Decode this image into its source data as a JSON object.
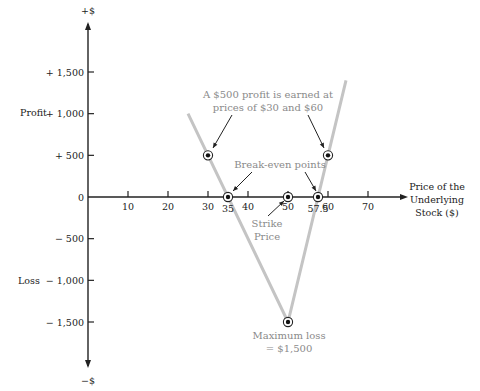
{
  "chart_data": {
    "type": "line",
    "title": "",
    "xlabel": "Price of the Underlying Stock ($)",
    "xlabel_lines": [
      "Price of the",
      "Underlying",
      "Stock ($)"
    ],
    "ylabel_top": "+$",
    "ylabel_bottom": "−$",
    "y_side_labels": {
      "profit": "Profit",
      "loss": "Loss"
    },
    "xlim": [
      0,
      72
    ],
    "ylim": [
      -2000,
      2000
    ],
    "x_ticks": [
      {
        "value": 10,
        "label": "10"
      },
      {
        "value": 20,
        "label": "20"
      },
      {
        "value": 30,
        "label": "30"
      },
      {
        "value": 40,
        "label": "40"
      },
      {
        "value": 50,
        "label": "50"
      },
      {
        "value": 60,
        "label": "60"
      },
      {
        "value": 70,
        "label": "70"
      }
    ],
    "x_extra_labels": [
      {
        "value": 35,
        "label": "35"
      },
      {
        "value": 57.5,
        "label": "57.5"
      }
    ],
    "y_ticks": [
      {
        "value": 1500,
        "label": "+ 1,500"
      },
      {
        "value": 1000,
        "label": "+ 1,000"
      },
      {
        "value": 500,
        "label": "+ 500"
      },
      {
        "value": 0,
        "label": "0"
      },
      {
        "value": -500,
        "label": "− 500"
      },
      {
        "value": -1000,
        "label": "− 1,000"
      },
      {
        "value": -1500,
        "label": "− 1,500"
      }
    ],
    "series": [
      {
        "name": "Payoff",
        "x": [
          25,
          50,
          64.5
        ],
        "y": [
          1000,
          -1500,
          1400
        ],
        "color": "#c4c4c4"
      }
    ],
    "points": [
      {
        "name": "profit-at-30",
        "x": 30,
        "y": 500
      },
      {
        "name": "profit-at-60",
        "x": 60,
        "y": 500
      },
      {
        "name": "break-even-35",
        "x": 35,
        "y": 0
      },
      {
        "name": "break-even-57-5",
        "x": 57.5,
        "y": 0
      },
      {
        "name": "strike-price-50",
        "x": 50,
        "y": 0
      },
      {
        "name": "maximum-loss",
        "x": 50,
        "y": -1500
      }
    ],
    "annotations": {
      "profit_note": [
        "A $500 profit is earned at",
        "prices of $30 and $60"
      ],
      "break_even": "Break-even points",
      "strike": [
        "Strike",
        "Price"
      ],
      "max_loss": [
        "Maximum loss",
        "= $1,500"
      ]
    },
    "grid": false,
    "legend": "none"
  }
}
